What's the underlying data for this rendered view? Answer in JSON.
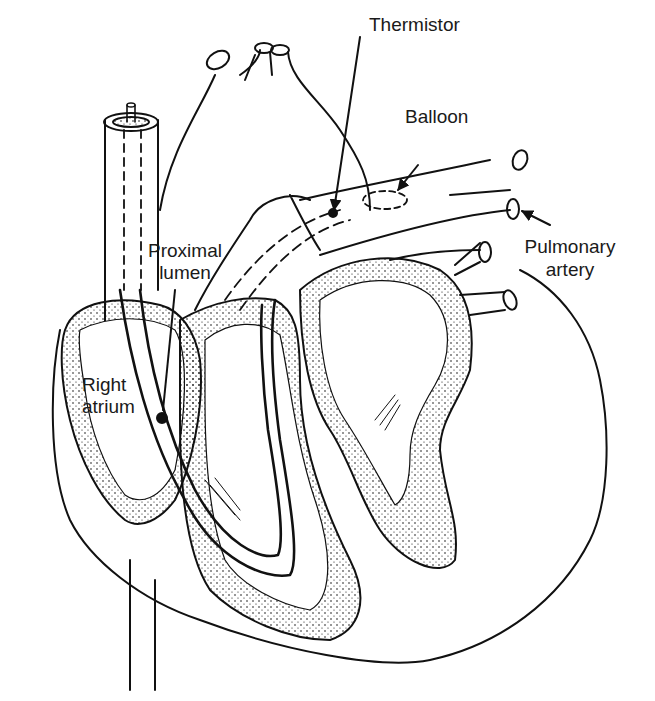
{
  "diagram": {
    "labels": {
      "thermistor": "Thermistor",
      "balloon": "Balloon",
      "pulmonary_artery_line1": "Pulmonary",
      "pulmonary_artery_line2": "artery",
      "proximal_lumen_line1": "Proximal",
      "proximal_lumen_line2": "lumen",
      "right_atrium_line1": "Right",
      "right_atrium_line2": "atrium"
    },
    "colors": {
      "ink": "#111111",
      "background": "#ffffff"
    }
  }
}
